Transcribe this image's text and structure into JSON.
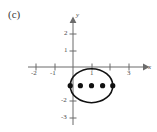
{
  "panel": {
    "label": "(c)"
  },
  "axes": {
    "x_name": "x",
    "y_name": "y",
    "x_ticks": [
      {
        "value": -2,
        "label": "-2",
        "px": 36
      },
      {
        "value": -1,
        "label": "-1",
        "px": 55
      },
      {
        "value": 1,
        "label": "1",
        "px": 92
      },
      {
        "value": 2,
        "label": "",
        "px": 110
      },
      {
        "value": 3,
        "label": "3",
        "px": 129
      }
    ],
    "y_ticks": [
      {
        "value": 2,
        "label": "2",
        "px": 34
      },
      {
        "value": 1,
        "label": "1",
        "px": 51
      },
      {
        "value": -2,
        "label": "-2",
        "px": 101
      },
      {
        "value": -3,
        "label": "-3",
        "px": 118
      }
    ]
  },
  "chart_data": {
    "type": "scatter",
    "title": "(c)",
    "xlabel": "x",
    "ylabel": "y",
    "xlim": [
      -2.6,
      3.8
    ],
    "ylim": [
      -3.6,
      2.6
    ],
    "grid": false,
    "legend": "none",
    "origin_px": {
      "x": 73,
      "y": 67
    },
    "scale_px_per_unit": {
      "x": 18.5,
      "y": 17.0
    },
    "shapes": [
      {
        "kind": "ellipse",
        "center": [
          1.0,
          -1.1
        ],
        "rx": 1.15,
        "ry": 1.0,
        "stroke": "#111111",
        "stroke_width": 1.6,
        "fill": "none"
      }
    ],
    "points": [
      {
        "x": -0.15,
        "y": -1.1,
        "label": ""
      },
      {
        "x": 0.4,
        "y": -1.1,
        "label": ""
      },
      {
        "x": 1.0,
        "y": -1.1,
        "label": ""
      },
      {
        "x": 1.6,
        "y": -1.1,
        "label": ""
      },
      {
        "x": 2.15,
        "y": -1.1,
        "label": ""
      }
    ],
    "point_style": {
      "marker": "filled-circle",
      "radius_px": 2.6,
      "color": "#111111"
    },
    "axis_style": {
      "color": "#6b6b6b",
      "stroke_width": 1.0,
      "tick_len_px": 4,
      "arrow": "both-positive-ends"
    }
  },
  "colors": {
    "background": "#ffffff",
    "axis": "#6b6b6b",
    "curve": "#111111",
    "point": "#111111",
    "text": "#4a4a4a"
  }
}
